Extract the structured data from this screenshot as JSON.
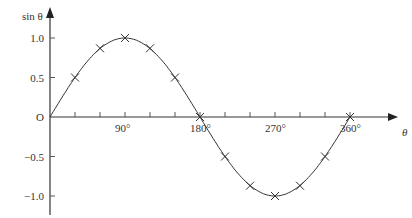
{
  "chart_data": {
    "type": "line",
    "title": "",
    "xlabel": "θ",
    "ylabel": "sin θ",
    "origin_label": "O",
    "x_tick_labels": [
      "90°",
      "180°",
      "270°",
      "360°"
    ],
    "y_tick_labels": [
      "1.0",
      "0.5",
      "−0.5",
      "−1.0"
    ],
    "xlim": [
      0,
      360
    ],
    "ylim": [
      -1.2,
      1.2
    ],
    "grid": false,
    "x": [
      0,
      30,
      60,
      90,
      120,
      150,
      180,
      210,
      240,
      270,
      300,
      330,
      360
    ],
    "series": [
      {
        "name": "sin θ",
        "values": [
          0,
          0.5,
          0.87,
          1.0,
          0.87,
          0.5,
          0,
          -0.5,
          -0.87,
          -1.0,
          -0.87,
          -0.5,
          0
        ],
        "marker": "x"
      }
    ]
  }
}
